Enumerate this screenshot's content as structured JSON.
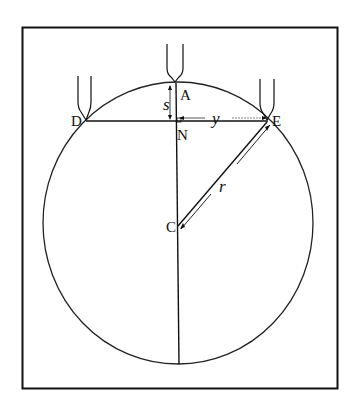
{
  "diagram": {
    "type": "geometry-circle-sagitta",
    "points": {
      "A": {
        "label": "A",
        "x": 175,
        "y": 83
      },
      "D": {
        "label": "D",
        "x": 86,
        "y": 121
      },
      "E": {
        "label": "E",
        "x": 267,
        "y": 121
      },
      "N": {
        "label": "N",
        "x": 176,
        "y": 121
      },
      "C": {
        "label": "C",
        "x": 178,
        "y": 226
      }
    },
    "segments": [
      {
        "from": "A",
        "to": "bottom",
        "label": ""
      },
      {
        "from": "D",
        "to": "E",
        "label": ""
      },
      {
        "from": "C",
        "to": "E",
        "label": "r"
      }
    ],
    "dimensions": {
      "s": "s",
      "y": "y",
      "r": "r"
    },
    "tuning_forks": [
      "at-A",
      "at-D",
      "at-E"
    ]
  }
}
